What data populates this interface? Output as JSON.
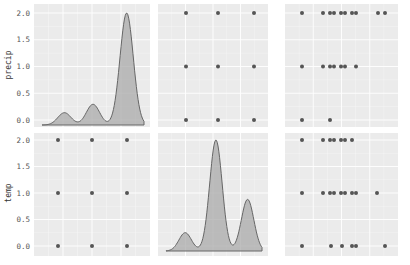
{
  "chart_data": {
    "type": "pairplot",
    "variables": [
      "precip",
      "temp"
    ],
    "grid": true,
    "background": "#ebebeb",
    "gridline_color": "#ffffff",
    "point_color": "#555555",
    "kde_fill": "#a9a9a9",
    "kde_line": "#666666",
    "y_ticks": [
      "0.0",
      "0.5",
      "1.0",
      "1.5",
      "2.0"
    ],
    "ylim": [
      0,
      2
    ],
    "row_labels": [
      "precip",
      "temp"
    ],
    "panels": [
      {
        "row": 0,
        "col": 0,
        "type": "kde",
        "variable": "precip",
        "peaks": [
          {
            "x_frac": 0.22,
            "height": 0.22
          },
          {
            "x_frac": 0.5,
            "height": 0.37
          },
          {
            "x_frac": 0.83,
            "height": 2.0
          }
        ]
      },
      {
        "row": 0,
        "col": 1,
        "type": "scatter",
        "x": "temp",
        "y": "precip",
        "points": [
          [
            0,
            0
          ],
          [
            1,
            0
          ],
          [
            2,
            0
          ],
          [
            0,
            1
          ],
          [
            1,
            1
          ],
          [
            2,
            1
          ],
          [
            0,
            2
          ],
          [
            1,
            2
          ],
          [
            2,
            2
          ]
        ]
      },
      {
        "row": 0,
        "col": 2,
        "type": "scatter",
        "y": "precip",
        "points_by_y": {
          "2": [
            302,
            323,
            330,
            334,
            341,
            345,
            352,
            356,
            378,
            385
          ],
          "1": [
            302,
            323,
            330,
            334,
            341,
            345,
            356
          ],
          "0": [
            302,
            330
          ]
        }
      },
      {
        "row": 1,
        "col": 0,
        "type": "scatter",
        "x": "precip",
        "y": "temp",
        "points": [
          [
            0,
            0
          ],
          [
            1,
            0
          ],
          [
            2,
            0
          ],
          [
            0,
            1
          ],
          [
            1,
            1
          ],
          [
            2,
            1
          ],
          [
            0,
            2
          ],
          [
            1,
            2
          ],
          [
            2,
            2
          ]
        ]
      },
      {
        "row": 1,
        "col": 1,
        "type": "kde",
        "variable": "temp",
        "peaks": [
          {
            "x_frac": 0.2,
            "height": 0.33
          },
          {
            "x_frac": 0.52,
            "height": 2.0
          },
          {
            "x_frac": 0.85,
            "height": 0.93
          }
        ]
      },
      {
        "row": 1,
        "col": 2,
        "type": "scatter",
        "y": "temp",
        "points_by_y": {
          "2": [
            302,
            323,
            330,
            334,
            341,
            345,
            352
          ],
          "1": [
            302,
            323,
            330,
            334,
            341,
            345,
            352,
            356,
            377
          ],
          "0": [
            302,
            331,
            342,
            352,
            356,
            385
          ]
        }
      }
    ]
  }
}
